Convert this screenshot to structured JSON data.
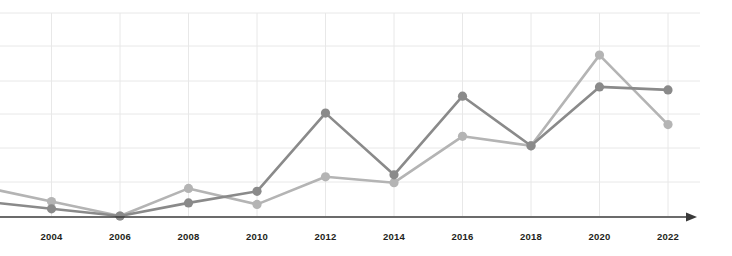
{
  "chart": {
    "title": "",
    "subtitle": "",
    "accent_dark": "#8a8a8a",
    "accent_light": "#b4b4b4",
    "grid_color": "#e8e8e8",
    "axis_color": "#3a3a3a",
    "background": "#ffffff"
  },
  "axis": {
    "x_tick_labels": [
      "2004",
      "2006",
      "2008",
      "2010",
      "2012",
      "2014",
      "2016",
      "2018",
      "2020",
      "2022"
    ]
  },
  "chart_data": {
    "type": "line",
    "title": "",
    "xlabel": "",
    "ylabel": "",
    "categories": [
      "2004",
      "2006",
      "2008",
      "2010",
      "2012",
      "2014",
      "2016",
      "2018",
      "2020",
      "2022"
    ],
    "x": [
      2004,
      2006,
      2008,
      2010,
      2012,
      2014,
      2016,
      2018,
      2020,
      2022
    ],
    "xlim": [
      2003,
      2023
    ],
    "ylim": [
      0,
      7
    ],
    "grid": true,
    "legend": "none",
    "series": [
      {
        "name": "Series 1",
        "color": "#8a8a8a",
        "values": [
          0.25,
          0.0,
          0.45,
          0.85,
          3.55,
          1.42,
          4.13,
          2.42,
          4.45,
          4.35
        ]
      },
      {
        "name": "Series 2",
        "color": "#b4b4b4",
        "values": [
          0.5,
          0.0,
          0.95,
          0.4,
          1.35,
          1.15,
          2.75,
          2.42,
          5.55,
          3.15
        ]
      }
    ]
  }
}
